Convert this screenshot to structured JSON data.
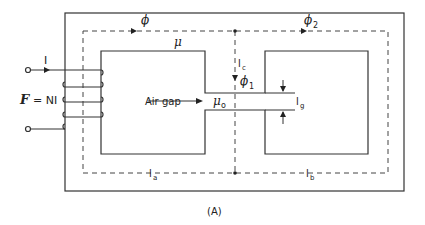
{
  "figure": {
    "caption": "(A)",
    "labels": {
      "current": "I",
      "mmf": "F",
      "mmf_eq": "= NI",
      "flux_total": "ϕ",
      "flux_2": "ϕ",
      "flux_2_sub": "2",
      "flux_1": "ϕ",
      "flux_1_sub": "1",
      "permeability": "μ",
      "air_gap": "Air gap",
      "mu_0": "μ",
      "mu_0_sub": "o",
      "l_c": "l",
      "l_c_sub": "c",
      "l_g": "l",
      "l_g_sub": "g",
      "l_a": "l",
      "l_a_sub": "a",
      "l_b": "l",
      "l_b_sub": "b"
    }
  }
}
